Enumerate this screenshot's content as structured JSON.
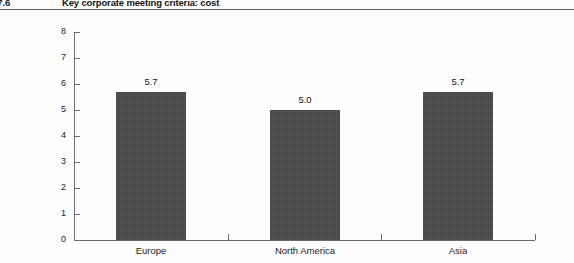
{
  "figure": {
    "number": "re 7.6",
    "title": "Key corporate meeting criteria: cost"
  },
  "chart_data": {
    "type": "bar",
    "title": "Key corporate meeting criteria: cost",
    "xlabel": "",
    "ylabel": "",
    "ylim": [
      0,
      8
    ],
    "yticks": [
      "0",
      "1",
      "2",
      "3",
      "4",
      "5",
      "6",
      "7",
      "8"
    ],
    "grid": false,
    "legend": null,
    "bar_color": "#4a4a4a",
    "categories": [
      "Europe",
      "North America",
      "Asia"
    ],
    "values": [
      5.7,
      5.0,
      5.7
    ],
    "data_labels": [
      "5.7",
      "5.0",
      "5.7"
    ]
  }
}
